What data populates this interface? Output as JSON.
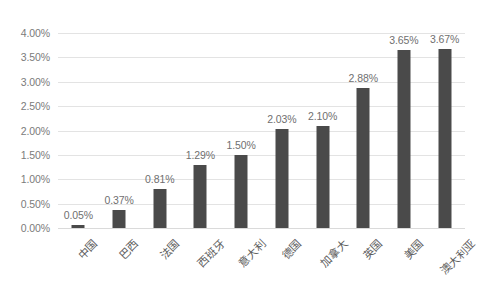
{
  "chart_data": {
    "type": "bar",
    "title": "",
    "subtitle": "",
    "xlabel": "",
    "ylabel": "",
    "categories": [
      "中国",
      "巴西",
      "法国",
      "西班牙",
      "意大利",
      "德国",
      "加拿大",
      "英国",
      "美国",
      "澳大利亚"
    ],
    "values": [
      0.05,
      0.37,
      0.81,
      1.29,
      1.5,
      2.03,
      2.1,
      2.88,
      3.65,
      3.67
    ],
    "value_labels": [
      "0.05%",
      "0.37%",
      "0.81%",
      "1.29%",
      "1.50%",
      "2.03%",
      "2.10%",
      "2.88%",
      "3.65%",
      "3.67%"
    ],
    "ylim": [
      0,
      4.0
    ],
    "ytick_values": [
      0.0,
      0.5,
      1.0,
      1.5,
      2.0,
      2.5,
      3.0,
      3.5,
      4.0
    ],
    "ytick_labels": [
      "0.00%",
      "0.50%",
      "1.00%",
      "1.50%",
      "2.00%",
      "2.50%",
      "3.00%",
      "3.50%",
      "4.00%"
    ],
    "grid": true,
    "grid_axis": "y",
    "legend": false,
    "legend_position": "none",
    "series": [
      {
        "name": "",
        "values": [
          0.05,
          0.37,
          0.81,
          1.29,
          1.5,
          2.03,
          2.1,
          2.88,
          3.65,
          3.67
        ]
      }
    ]
  },
  "style": {
    "bar_color": "#4a4a4a",
    "grid_color": "#e3e3e3",
    "axis_label_color": "#7b7b7b",
    "value_label_color": "#6f6f6f",
    "category_label_color": "#5d5d5d",
    "background": "#ffffff"
  }
}
